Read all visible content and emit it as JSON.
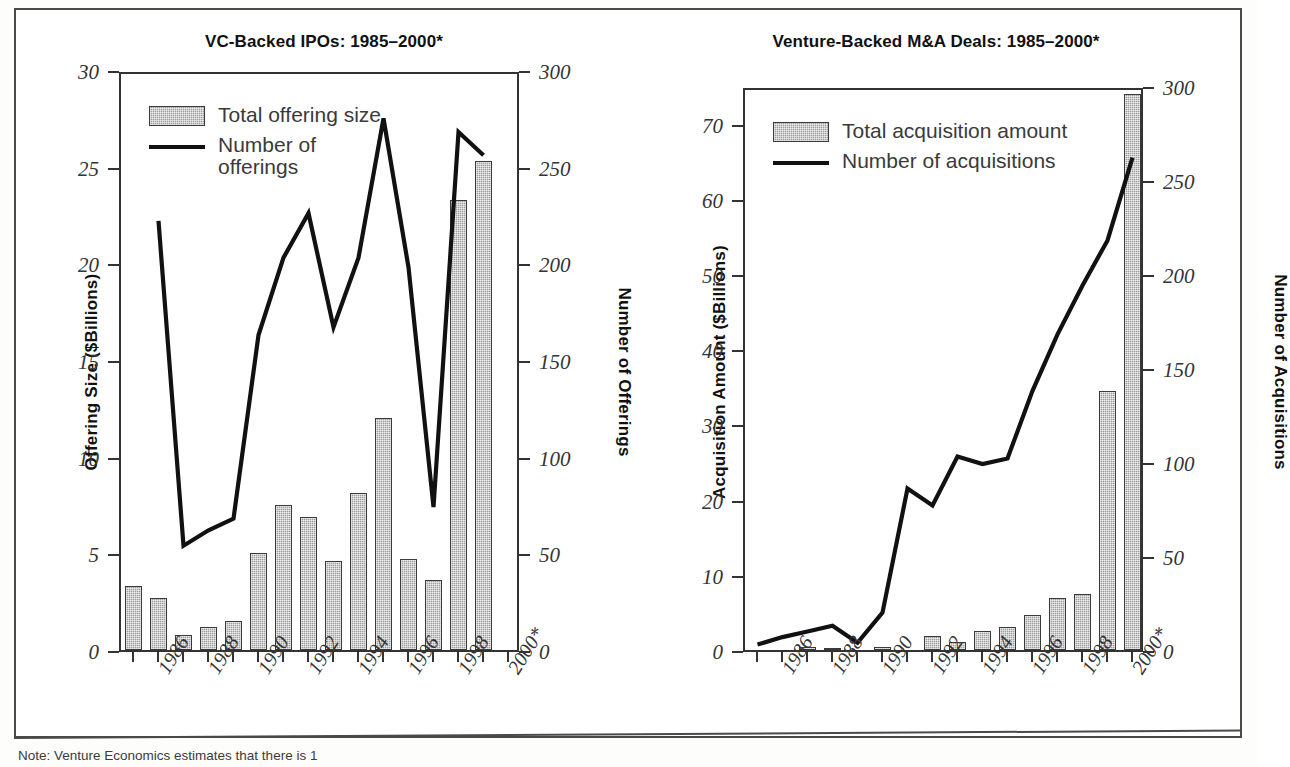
{
  "figure": {
    "note": "Note: Venture Economics estimates that there is 1"
  },
  "charts": [
    {
      "id": "vc-backed-ipos",
      "title": "VC-Backed IPOs: 1985–2000*",
      "left_axis_title": "Offering Size ($Billions)",
      "right_axis_title": "Number of Offerings",
      "legend": [
        {
          "type": "bar",
          "label": "Total offering size"
        },
        {
          "type": "line",
          "label": "Number of\nofferings"
        }
      ],
      "chart_data": {
        "type": "bar",
        "title": "VC-Backed IPOs: 1985–2000*",
        "xlabel": "",
        "ylabel": "Offering Size ($Billions)",
        "y2label": "Number of Offerings",
        "ylim": [
          0,
          30
        ],
        "y2lim": [
          0,
          300
        ],
        "yticks": [
          0,
          5,
          10,
          15,
          20,
          25,
          30
        ],
        "y2ticks": [
          0,
          50,
          100,
          150,
          200,
          250,
          300
        ],
        "grid": false,
        "legend_position": "top-left",
        "categories": [
          "1985",
          "1986",
          "1987",
          "1988",
          "1989",
          "1990",
          "1991",
          "1992",
          "1993",
          "1994",
          "1995",
          "1996",
          "1997",
          "1998",
          "1999",
          "2000*"
        ],
        "tick_labels": [
          "1986",
          "1988",
          "1990",
          "1992",
          "1994",
          "1996",
          "1998",
          "2000*"
        ],
        "series": [
          {
            "name": "Total offering size",
            "type": "bar",
            "axis": "left",
            "unit": "$Billions",
            "values": [
              3.3,
              2.7,
              0.8,
              1.2,
              1.5,
              5.0,
              7.5,
              6.9,
              4.6,
              8.1,
              12.0,
              4.7,
              3.6,
              23.3,
              25.3,
              null
            ]
          },
          {
            "name": "Number of offerings",
            "type": "line",
            "axis": "right",
            "unit": "count",
            "values": [
              null,
              224,
              56,
              64,
              70,
              165,
              205,
              228,
              169,
              205,
              277,
              200,
              76,
              270,
              258,
              null
            ]
          }
        ]
      }
    },
    {
      "id": "venture-backed-ma-deals",
      "title": "Venture-Backed M&A Deals: 1985–2000*",
      "left_axis_title": "Acquisition Amount ($Billions)",
      "right_axis_title": "Number of Acquisitions",
      "legend": [
        {
          "type": "bar",
          "label": "Total acquisition amount"
        },
        {
          "type": "line",
          "label": "Number of acquisitions"
        }
      ],
      "chart_data": {
        "type": "bar",
        "title": "Venture-Backed M&A Deals: 1985–2000*",
        "xlabel": "",
        "ylabel": "Acquisition Amount ($Billions)",
        "y2label": "Number of Acquisitions",
        "ylim": [
          0,
          75
        ],
        "y2lim": [
          0,
          300
        ],
        "yticks": [
          0,
          10,
          20,
          30,
          40,
          50,
          60,
          70
        ],
        "y2ticks": [
          0,
          50,
          100,
          150,
          200,
          250,
          300
        ],
        "grid": false,
        "legend_position": "top-left",
        "categories": [
          "1985",
          "1986",
          "1987",
          "1988",
          "1989",
          "1990",
          "1991",
          "1992",
          "1993",
          "1994",
          "1995",
          "1996",
          "1997",
          "1998",
          "1999",
          "2000*"
        ],
        "tick_labels": [
          "1986",
          "1988",
          "1990",
          "1992",
          "1994",
          "1996",
          "1998",
          "2000*"
        ],
        "series": [
          {
            "name": "Total acquisition amount",
            "type": "bar",
            "axis": "left",
            "unit": "$Billions",
            "values": [
              0.0,
              0.0,
              0.4,
              0.2,
              0.0,
              0.4,
              0.0,
              1.8,
              1.0,
              2.5,
              3.0,
              4.6,
              6.9,
              7.4,
              34.5,
              74.0
            ]
          },
          {
            "name": "Number of acquisitions",
            "type": "line",
            "axis": "right",
            "unit": "count",
            "values": [
              5,
              9,
              12,
              15,
              6,
              22,
              88,
              79,
              105,
              101,
              104,
              140,
              170,
              196,
              220,
              264
            ]
          }
        ]
      }
    }
  ]
}
